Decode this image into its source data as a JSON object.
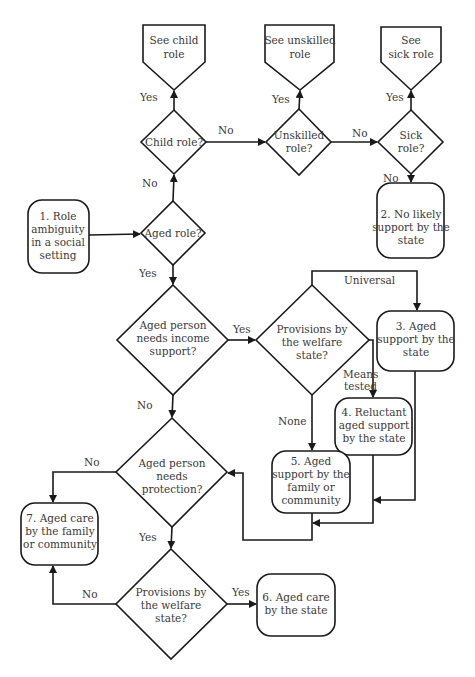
{
  "diagram": {
    "type": "flowchart",
    "colors": {
      "stroke": "#1a1a1a",
      "text": "#3a3a3a",
      "background": "#ffffff"
    },
    "nodes": {
      "see_child": {
        "shape": "off-page-pentagon",
        "lines": [
          "See child",
          "role"
        ]
      },
      "see_unskilled": {
        "shape": "off-page-pentagon",
        "lines": [
          "See unskilled",
          "role"
        ]
      },
      "see_sick": {
        "shape": "off-page-pentagon",
        "lines": [
          "See",
          "sick role"
        ]
      },
      "child_role": {
        "shape": "diamond",
        "lines": [
          "Child role?"
        ]
      },
      "unskilled_role": {
        "shape": "diamond",
        "lines": [
          "Unskilled",
          "role?"
        ]
      },
      "sick_role": {
        "shape": "diamond",
        "lines": [
          "Sick",
          "role?"
        ]
      },
      "start": {
        "shape": "rounded-box",
        "lines": [
          "1. Role",
          "ambiguity",
          "in a social",
          "setting"
        ]
      },
      "aged_role": {
        "shape": "diamond",
        "lines": [
          "Aged role?"
        ]
      },
      "no_support": {
        "shape": "rounded-box",
        "lines": [
          "2. No likely",
          "support by the",
          "state"
        ]
      },
      "income_support": {
        "shape": "diamond",
        "lines": [
          "Aged person",
          "needs income",
          "support?"
        ]
      },
      "provisions_1": {
        "shape": "diamond",
        "lines": [
          "Provisions by",
          "the welfare",
          "state?"
        ]
      },
      "state_support": {
        "shape": "rounded-box",
        "lines": [
          "3. Aged",
          "support by the",
          "state"
        ]
      },
      "reluctant_support": {
        "shape": "rounded-box",
        "lines": [
          "4. Reluctant",
          "aged support",
          "by the state"
        ]
      },
      "family_support": {
        "shape": "rounded-box",
        "lines": [
          "5. Aged",
          "support by the",
          "family or",
          "community"
        ]
      },
      "protection": {
        "shape": "diamond",
        "lines": [
          "Aged person",
          "needs",
          "protection?"
        ]
      },
      "family_care": {
        "shape": "rounded-box",
        "lines": [
          "7. Aged care",
          "by the family",
          "or community"
        ]
      },
      "provisions_2": {
        "shape": "diamond",
        "lines": [
          "Provisions by",
          "the welfare",
          "state?"
        ]
      },
      "state_care": {
        "shape": "rounded-box",
        "lines": [
          "6. Aged care",
          "by the state"
        ]
      }
    },
    "edge_labels": {
      "child_yes": "Yes",
      "child_no": "No",
      "unskilled_yes": "Yes",
      "unskilled_no": "No",
      "sick_yes": "Yes",
      "sick_no": "No",
      "aged_no": "No",
      "aged_yes": "Yes",
      "income_yes": "Yes",
      "income_no": "No",
      "prov1_universal": "Universal",
      "prov1_means_1": "Means",
      "prov1_means_2": "tested",
      "prov1_none": "None",
      "protection_no": "No",
      "protection_yes": "Yes",
      "prov2_no": "No",
      "prov2_yes": "Yes"
    }
  }
}
